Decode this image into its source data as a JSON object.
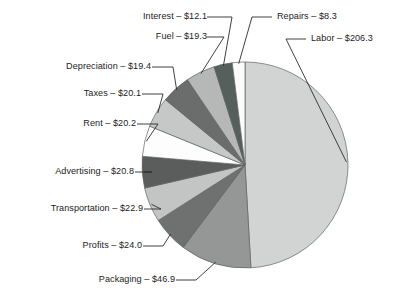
{
  "chart_data": {
    "type": "pie",
    "title": "",
    "subtitle": "",
    "xlabel": "",
    "ylabel": "",
    "legend_position": "none",
    "grid": false,
    "currency": "$",
    "total": 460.3,
    "categories": [
      "Labor",
      "Packaging",
      "Profits",
      "Transportation",
      "Advertising",
      "Rent",
      "Taxes",
      "Depreciation",
      "Fuel",
      "Interest",
      "Repairs"
    ],
    "values": [
      206.3,
      46.9,
      24.0,
      22.9,
      20.8,
      20.2,
      20.1,
      19.4,
      19.3,
      12.1,
      8.3
    ],
    "slices": [
      {
        "name": "Labor",
        "value": 206.3,
        "label": "Labor – $206.3",
        "color": "#d2d4d3",
        "side": "right"
      },
      {
        "name": "Packaging",
        "value": 46.9,
        "label": "Packaging – $46.9",
        "color": "#949796",
        "side": "left"
      },
      {
        "name": "Profits",
        "value": 24.0,
        "label": "Profits – $24.0",
        "color": "#6f7170",
        "side": "left"
      },
      {
        "name": "Transportation",
        "value": 22.9,
        "label": "Transportation – $22.9",
        "color": "#c3c5c4",
        "side": "left"
      },
      {
        "name": "Advertising",
        "value": 20.8,
        "label": "Advertising – $20.8",
        "color": "#5b5d5c",
        "side": "left"
      },
      {
        "name": "Rent",
        "value": 20.2,
        "label": "Rent – $20.2",
        "color": "#fdfdfd",
        "side": "left"
      },
      {
        "name": "Taxes",
        "value": 20.1,
        "label": "Taxes – $20.1",
        "color": "#c6c8c7",
        "side": "left"
      },
      {
        "name": "Depreciation",
        "value": 19.4,
        "label": "Depreciation – $19.4",
        "color": "#6b6d6c",
        "side": "left"
      },
      {
        "name": "Fuel",
        "value": 19.3,
        "label": "Fuel – $19.3",
        "color": "#b6b8b7",
        "side": "left"
      },
      {
        "name": "Interest",
        "value": 12.1,
        "label": "Interest – $12.1",
        "color": "#55605d",
        "side": "left"
      },
      {
        "name": "Repairs",
        "value": 8.3,
        "label": "Repairs – $8.3",
        "color": "#fbfbfb",
        "side": "right"
      }
    ]
  },
  "geometry": {
    "cx": 245,
    "cy": 165,
    "r": 103,
    "start_angle_deg": -90,
    "direction": "clockwise"
  },
  "labels": {
    "interest": "Interest – $12.1",
    "fuel": "Fuel – $19.3",
    "depreciation": "Depreciation – $19.4",
    "taxes": "Taxes – $20.1",
    "rent": "Rent – $20.2",
    "advertising": "Advertising – $20.8",
    "transportation": "Transportation – $22.9",
    "profits": "Profits – $24.0",
    "packaging": "Packaging – $46.9",
    "repairs": "Repairs – $8.3",
    "labor": "Labor – $206.3"
  }
}
